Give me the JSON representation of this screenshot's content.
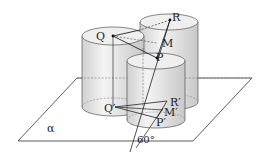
{
  "diagram": {
    "type": "geometry",
    "plane_label": "α",
    "angle_label": "60°",
    "points": {
      "Q": "Q",
      "R": "R",
      "M": "M",
      "P": "P",
      "Q_prime": "Q′",
      "R_prime": "R′",
      "M_prime": "M′",
      "P_prime": "P′"
    },
    "colors": {
      "stroke": "#333333",
      "cylinder_fill": "#e6e6e6",
      "background": "#ffffff"
    }
  }
}
